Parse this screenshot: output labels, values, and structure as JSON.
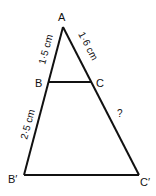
{
  "diagram": {
    "type": "similar-triangles",
    "vertices": {
      "A": "A",
      "B": "B",
      "C": "C",
      "B_prime": "B′",
      "C_prime": "C′"
    },
    "measurements": {
      "AB": "1·5 cm",
      "AC": "1·6 cm",
      "BB_prime": "2·5 cm",
      "CC_prime": "?"
    },
    "colors": {
      "line": "#111111",
      "background": "#ffffff"
    }
  }
}
